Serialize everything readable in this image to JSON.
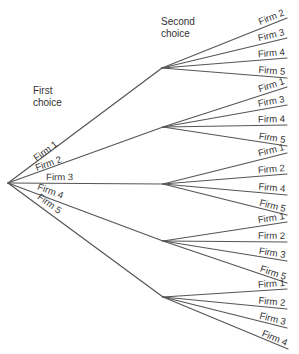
{
  "diagram": {
    "type": "decision-tree",
    "headers": {
      "first_line1": "First",
      "first_line2": "choice",
      "second_line1": "Second",
      "second_line2": "choice"
    },
    "root": {
      "x": 8,
      "y": 183
    },
    "first_choice": [
      {
        "label": "Firm 1",
        "node": {
          "x": 162,
          "y": 68
        },
        "second_choice": [
          {
            "label": "Firm 2",
            "end": {
              "x": 287,
              "y": 18
            }
          },
          {
            "label": "Firm 3",
            "end": {
              "x": 287,
              "y": 38
            }
          },
          {
            "label": "Firm 4",
            "end": {
              "x": 287,
              "y": 58
            }
          },
          {
            "label": "Firm 5",
            "end": {
              "x": 287,
              "y": 78
            }
          }
        ]
      },
      {
        "label": "Firm 2",
        "node": {
          "x": 163,
          "y": 127
        },
        "second_choice": [
          {
            "label": "Firm 1",
            "end": {
              "x": 287,
              "y": 87
            }
          },
          {
            "label": "Firm 3",
            "end": {
              "x": 287,
              "y": 105
            }
          },
          {
            "label": "Firm 4",
            "end": {
              "x": 287,
              "y": 125
            }
          },
          {
            "label": "Firm 5",
            "end": {
              "x": 287,
              "y": 146
            }
          }
        ]
      },
      {
        "label": "Firm 3",
        "node": {
          "x": 163,
          "y": 184
        },
        "second_choice": [
          {
            "label": "Firm 1",
            "end": {
              "x": 287,
              "y": 153
            }
          },
          {
            "label": "Firm 2",
            "end": {
              "x": 287,
              "y": 174
            }
          },
          {
            "label": "Firm 4",
            "end": {
              "x": 287,
              "y": 195
            }
          },
          {
            "label": "Firm 5",
            "end": {
              "x": 287,
              "y": 215
            }
          }
        ]
      },
      {
        "label": "Firm 4",
        "node": {
          "x": 163,
          "y": 241
        },
        "second_choice": [
          {
            "label": "Firm 1",
            "end": {
              "x": 287,
              "y": 222
            }
          },
          {
            "label": "Firm 2",
            "end": {
              "x": 287,
              "y": 242
            }
          },
          {
            "label": "Firm 3",
            "end": {
              "x": 287,
              "y": 261
            }
          },
          {
            "label": "Firm 5",
            "end": {
              "x": 287,
              "y": 283
            }
          }
        ]
      },
      {
        "label": "Firm 5",
        "node": {
          "x": 163,
          "y": 297
        },
        "second_choice": [
          {
            "label": "Firm 1",
            "end": {
              "x": 287,
              "y": 289
            }
          },
          {
            "label": "Firm 2",
            "end": {
              "x": 287,
              "y": 309
            }
          },
          {
            "label": "Firm 3",
            "end": {
              "x": 287,
              "y": 328
            }
          },
          {
            "label": "Firm 4",
            "end": {
              "x": 288,
              "y": 349
            }
          }
        ]
      }
    ]
  }
}
